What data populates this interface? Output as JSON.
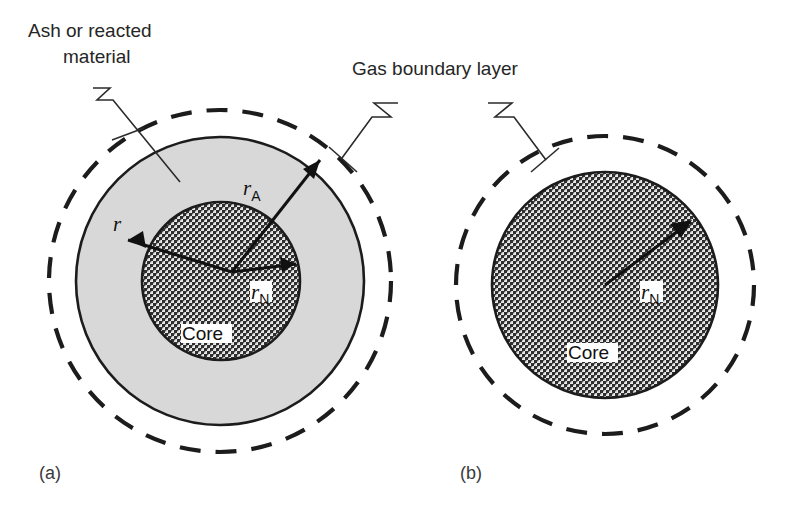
{
  "figure": {
    "width": 788,
    "height": 512,
    "background_color": "#ffffff"
  },
  "colors": {
    "ash_fill": "#d8d8d8",
    "core_fill": "#8a8a8a",
    "line": "#1c1c1c",
    "text": "#262626",
    "label_plate": "#ffffff"
  },
  "callouts": [
    {
      "id": "ash-callout",
      "lines": [
        "Ash or reacted",
        "material"
      ],
      "line1": "Ash or reacted",
      "line2": "material"
    },
    {
      "id": "gas-callout",
      "lines": [
        "Gas boundary layer"
      ],
      "line1": "Gas boundary layer"
    }
  ],
  "panels": [
    {
      "id": "panel-a",
      "label": "(a)",
      "core_label": "Core",
      "radii": [
        {
          "id": "r",
          "symbol": "r",
          "subscript": ""
        },
        {
          "id": "rA",
          "symbol": "r",
          "subscript": "A"
        },
        {
          "id": "rN",
          "symbol": "r",
          "subscript": "N"
        }
      ],
      "regions": [
        "gas boundary layer",
        "ash or reacted material",
        "core"
      ]
    },
    {
      "id": "panel-b",
      "label": "(b)",
      "core_label": "Core",
      "radii": [
        {
          "id": "rN",
          "symbol": "r",
          "subscript": "N"
        }
      ],
      "regions": [
        "gas boundary layer",
        "core"
      ]
    }
  ]
}
